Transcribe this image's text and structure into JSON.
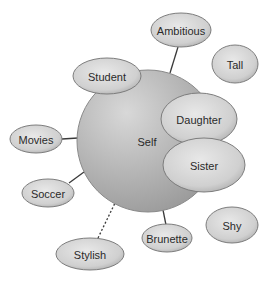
{
  "diagram": {
    "type": "concept-map",
    "center": {
      "label": "Self",
      "cx": 148,
      "cy": 141,
      "r": 71,
      "label_x": 147,
      "label_y": 142
    },
    "nodes": [
      {
        "id": "ambitious",
        "label": "Ambitious",
        "cx": 181,
        "cy": 30,
        "rx": 30,
        "ry": 17
      },
      {
        "id": "tall",
        "label": "Tall",
        "cx": 235,
        "cy": 64,
        "rx": 23,
        "ry": 19
      },
      {
        "id": "student",
        "label": "Student",
        "cx": 107,
        "cy": 76,
        "rx": 34,
        "ry": 18
      },
      {
        "id": "daughter",
        "label": "Daughter",
        "cx": 199,
        "cy": 119,
        "rx": 38,
        "ry": 26
      },
      {
        "id": "sister",
        "label": "Sister",
        "cx": 204,
        "cy": 165,
        "rx": 41,
        "ry": 27
      },
      {
        "id": "movies",
        "label": "Movies",
        "cx": 36,
        "cy": 139,
        "rx": 26,
        "ry": 14
      },
      {
        "id": "soccer",
        "label": "Soccer",
        "cx": 48,
        "cy": 193,
        "rx": 26,
        "ry": 14
      },
      {
        "id": "stylish",
        "label": "Stylish",
        "cx": 90,
        "cy": 254,
        "rx": 34,
        "ry": 16
      },
      {
        "id": "brunette",
        "label": "Brunette",
        "cx": 167,
        "cy": 238,
        "rx": 25,
        "ry": 14
      },
      {
        "id": "shy",
        "label": "Shy",
        "cx": 232,
        "cy": 225,
        "rx": 26,
        "ry": 18
      }
    ],
    "connectors": [
      {
        "from": "ambitious",
        "to": "self",
        "style": "solid",
        "x1": 178,
        "y1": 47,
        "x2": 170,
        "y2": 73
      },
      {
        "from": "movies",
        "to": "self",
        "style": "solid",
        "x1": 62,
        "y1": 139,
        "x2": 78,
        "y2": 138
      },
      {
        "from": "soccer",
        "to": "self",
        "style": "solid",
        "x1": 69,
        "y1": 183,
        "x2": 84,
        "y2": 172
      },
      {
        "from": "stylish",
        "to": "self",
        "style": "dotted",
        "x1": 98,
        "y1": 238,
        "x2": 115,
        "y2": 203
      },
      {
        "from": "brunette",
        "to": "self",
        "style": "solid",
        "x1": 163,
        "y1": 210,
        "x2": 166,
        "y2": 225
      }
    ],
    "colors": {
      "center_light": "#d4d4d4",
      "center_dark": "#939393",
      "center_stroke": "#8a8a8a",
      "node_light": "#e6e6e6",
      "node_dark": "#a9a9a9",
      "node_stroke": "#7d7d7d",
      "text": "#2a2a2a"
    }
  }
}
